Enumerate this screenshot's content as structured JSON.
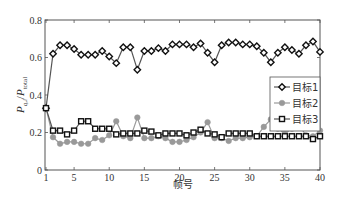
{
  "chart_data": {
    "type": "line",
    "title": "",
    "xlabel": "帧号",
    "ylabel_main": "P",
    "ylabel_sub": "q,i",
    "ylabel_div": "/",
    "ylabel_main2": "P",
    "ylabel_sub2": "total",
    "xlim": [
      1,
      40
    ],
    "ylim": [
      0,
      0.8
    ],
    "xticks": [
      1,
      5,
      10,
      15,
      20,
      25,
      30,
      35,
      40
    ],
    "yticks": [
      0,
      0.2,
      0.4,
      0.6,
      0.8
    ],
    "ytick_labels": [
      "0",
      "0.2",
      "0.4",
      "0.6",
      "0.8"
    ],
    "grid": false,
    "legend_position": "right-middle",
    "x": [
      1,
      2,
      3,
      4,
      5,
      6,
      7,
      8,
      9,
      10,
      11,
      12,
      13,
      14,
      15,
      16,
      17,
      18,
      19,
      20,
      21,
      22,
      23,
      24,
      25,
      26,
      27,
      28,
      29,
      30,
      31,
      32,
      33,
      34,
      35,
      36,
      37,
      38,
      39,
      40
    ],
    "series": [
      {
        "name": "目标1",
        "marker": "diamond",
        "color": "#111111",
        "values": [
          0.33,
          0.62,
          0.665,
          0.665,
          0.645,
          0.615,
          0.615,
          0.615,
          0.635,
          0.605,
          0.57,
          0.655,
          0.655,
          0.535,
          0.635,
          0.635,
          0.65,
          0.635,
          0.67,
          0.67,
          0.67,
          0.655,
          0.675,
          0.625,
          0.575,
          0.665,
          0.68,
          0.68,
          0.67,
          0.67,
          0.66,
          0.625,
          0.575,
          0.625,
          0.655,
          0.64,
          0.62,
          0.665,
          0.685,
          0.63
        ]
      },
      {
        "name": "目标2",
        "marker": "circle",
        "color": "#999999",
        "values": [
          0.33,
          0.175,
          0.14,
          0.15,
          0.15,
          0.14,
          0.14,
          0.17,
          0.16,
          0.185,
          0.26,
          0.18,
          0.17,
          0.28,
          0.17,
          0.17,
          0.18,
          0.17,
          0.15,
          0.15,
          0.16,
          0.175,
          0.2,
          0.255,
          0.17,
          0.17,
          0.155,
          0.17,
          0.17,
          0.175,
          0.18,
          0.23,
          0.27,
          0.22,
          0.195,
          0.22,
          0.24,
          0.185,
          0.18,
          0.21
        ]
      },
      {
        "name": "目标3",
        "marker": "square",
        "color": "#111111",
        "values": [
          0.33,
          0.21,
          0.21,
          0.19,
          0.21,
          0.26,
          0.26,
          0.22,
          0.22,
          0.22,
          0.19,
          0.195,
          0.195,
          0.195,
          0.21,
          0.205,
          0.185,
          0.195,
          0.195,
          0.195,
          0.185,
          0.2,
          0.215,
          0.195,
          0.19,
          0.175,
          0.195,
          0.195,
          0.195,
          0.195,
          0.18,
          0.18,
          0.18,
          0.18,
          0.18,
          0.18,
          0.18,
          0.18,
          0.165,
          0.18
        ]
      }
    ]
  }
}
